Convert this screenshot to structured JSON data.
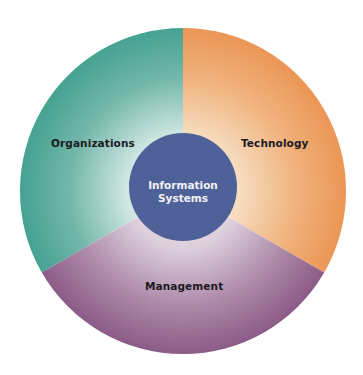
{
  "diagram": {
    "center": {
      "line1": "Information",
      "line2": "Systems",
      "color": "#4f6199"
    },
    "segments": [
      {
        "id": "organizations",
        "label": "Organizations",
        "color": "#4aa594"
      },
      {
        "id": "technology",
        "label": "Technology",
        "color": "#ec9a5a"
      },
      {
        "id": "management",
        "label": "Management",
        "color": "#8e5f8a"
      }
    ]
  }
}
